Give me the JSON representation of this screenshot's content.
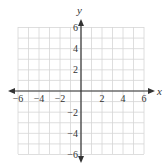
{
  "chart_data": {
    "type": "scatter",
    "title": "",
    "xlabel": "x",
    "ylabel": "y",
    "xlim": [
      -6,
      6
    ],
    "ylim": [
      -6,
      6
    ],
    "grid": true,
    "grid_step": 1,
    "x_ticks": [
      -6,
      -4,
      -2,
      2,
      4,
      6
    ],
    "y_ticks": [
      6,
      4,
      2,
      -2,
      -4,
      -6
    ],
    "x_tick_labels": [
      "−6",
      "−4",
      "−2",
      "2",
      "4",
      "6"
    ],
    "y_tick_labels": [
      "6",
      "4",
      "2",
      "−2",
      "−4",
      "−6"
    ],
    "series": [],
    "colors": {
      "grid": "#d6d6d6",
      "axis": "#333333",
      "background": "#ffffff"
    }
  },
  "labels": {
    "x_axis": "x",
    "y_axis": "y"
  }
}
